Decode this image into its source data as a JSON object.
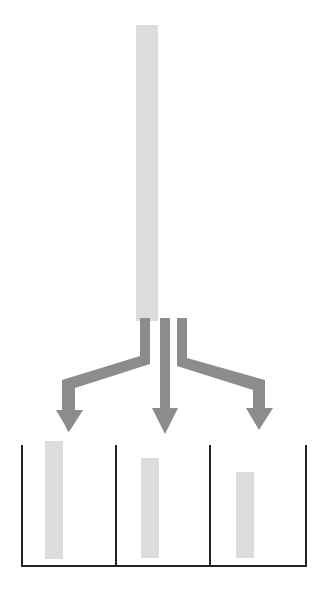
{
  "top_matrix": {
    "highlight_column": 1,
    "rows": [
      [
        1,
        1,
        1,
        1
      ],
      [
        2,
        3,
        1,
        1
      ],
      [
        3,
        2,
        1,
        1
      ],
      [
        3,
        3,
        1,
        2
      ],
      [
        1,
        2,
        1,
        3
      ],
      [
        1,
        1,
        1,
        3
      ],
      [
        3,
        1,
        2,
        1
      ],
      [
        1,
        1,
        2,
        1
      ],
      [
        1,
        3,
        2,
        2
      ],
      [
        3,
        2,
        2,
        3
      ],
      [
        2,
        2,
        2,
        3
      ],
      [
        3,
        3,
        3,
        1
      ],
      [
        2,
        2,
        3,
        2
      ],
      [
        2,
        1,
        3,
        2
      ],
      [
        1,
        1,
        3,
        3
      ]
    ]
  },
  "groups": [
    {
      "label": "1",
      "rows": [
        [
          1,
          1,
          1,
          1
        ],
        [
          1,
          1,
          1,
          3
        ],
        [
          3,
          1,
          2,
          1
        ],
        [
          1,
          1,
          2,
          1
        ],
        [
          2,
          1,
          3,
          2
        ],
        [
          1,
          1,
          3,
          3
        ]
      ]
    },
    {
      "label": "2",
      "rows": [
        [
          3,
          2,
          1,
          1
        ],
        [
          1,
          2,
          1,
          3
        ],
        [
          3,
          2,
          2,
          3
        ],
        [
          2,
          2,
          2,
          3
        ],
        [
          2,
          2,
          3,
          2
        ]
      ]
    },
    {
      "label": "3",
      "rows": [
        [
          2,
          3,
          1,
          1
        ],
        [
          3,
          3,
          1,
          2
        ],
        [
          1,
          3,
          2,
          2
        ],
        [
          3,
          3,
          3,
          1
        ]
      ]
    }
  ],
  "colors": {
    "arrow": "#8c8c8c",
    "highlight": "#dcdcdc",
    "text": "#555555",
    "lines": "#222222"
  }
}
